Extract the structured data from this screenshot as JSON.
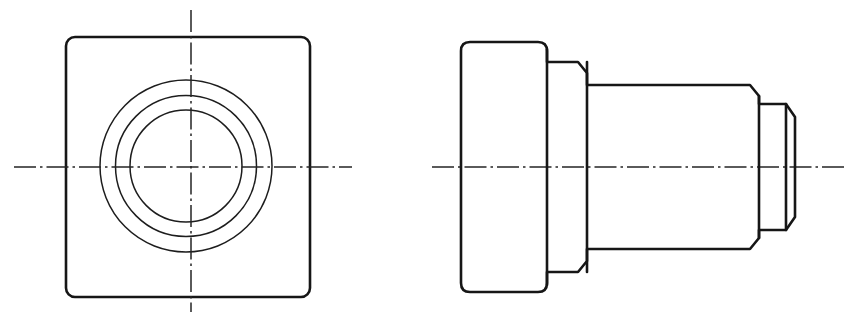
{
  "document": {
    "title": "Engineering Drawing — Stepped Shaft with Square Flange",
    "drawing_type": "orthographic-two-view",
    "sheet": {
      "width": 858,
      "height": 319,
      "background": "#ffffff"
    },
    "line_colors": {
      "visible_outline": "#161616",
      "thin_circle": "#1d1d1d",
      "centerline": "#242424"
    },
    "line_widths": {
      "visible_outline": 2.6,
      "thin_circle": 1.5,
      "centerline": 1.5
    },
    "labels": {
      "left_view_name": "front-view",
      "right_view_name": "side-view"
    }
  },
  "geometry": {
    "axis_y": 167,
    "front_view": {
      "square": {
        "x": 66,
        "y": 37,
        "width": 244,
        "height": 260,
        "corner_radius": 9
      },
      "center": {
        "cx": 186,
        "cy": 166
      },
      "circles": [
        {
          "name": "outer-circle",
          "r": 86
        },
        {
          "name": "middle-circle",
          "r": 70.5
        },
        {
          "name": "inner-circle",
          "r": 56
        }
      ],
      "vertical_centerline": {
        "x": 191,
        "y1": 10,
        "y2": 312
      },
      "horizontal_centerline": {
        "y": 167,
        "x1": 14,
        "x2": 352
      }
    },
    "side_view": {
      "horizontal_centerline": {
        "y": 167,
        "x1": 432,
        "x2": 848
      },
      "profile": [
        [
          468,
          42
        ],
        [
          540,
          42
        ],
        [
          547,
          49
        ],
        [
          547,
          62
        ],
        [
          578,
          62
        ],
        [
          587,
          73
        ],
        [
          587,
          85
        ],
        [
          750,
          85
        ],
        [
          759,
          96
        ],
        [
          759,
          104
        ],
        [
          786,
          104
        ],
        [
          795,
          117
        ],
        [
          795,
          217
        ],
        [
          786,
          230
        ],
        [
          759,
          230
        ],
        [
          759,
          238
        ],
        [
          750,
          249
        ],
        [
          587,
          249
        ],
        [
          587,
          261
        ],
        [
          578,
          272
        ],
        [
          547,
          272
        ],
        [
          547,
          285
        ],
        [
          540,
          292
        ],
        [
          468,
          292
        ],
        [
          461,
          285
        ],
        [
          461,
          49
        ]
      ],
      "internal_step_lines": [
        {
          "name": "flange-step-line",
          "x": 547,
          "y1": 49,
          "y2": 285
        },
        {
          "name": "second-step-line",
          "x": 587,
          "y1": 62,
          "y2": 272
        },
        {
          "name": "third-step-line",
          "x": 759,
          "y1": 96,
          "y2": 238
        },
        {
          "name": "fourth-step-line",
          "x": 786,
          "y1": 104,
          "y2": 230
        }
      ],
      "chamfers": [
        {
          "name": "chamfer-1-top",
          "from": [
            578,
            62
          ],
          "to": [
            587,
            73
          ]
        },
        {
          "name": "chamfer-2-top",
          "from": [
            750,
            85
          ],
          "to": [
            759,
            96
          ]
        },
        {
          "name": "chamfer-3-top",
          "from": [
            786,
            104
          ],
          "to": [
            795,
            117
          ]
        },
        {
          "name": "chamfer-3-bottom",
          "from": [
            795,
            217
          ],
          "to": [
            786,
            230
          ]
        },
        {
          "name": "chamfer-2-bottom",
          "from": [
            759,
            238
          ],
          "to": [
            750,
            249
          ]
        },
        {
          "name": "chamfer-1-bottom",
          "from": [
            587,
            261
          ],
          "to": [
            578,
            272
          ]
        }
      ],
      "flange_corner_radius": 9
    }
  }
}
